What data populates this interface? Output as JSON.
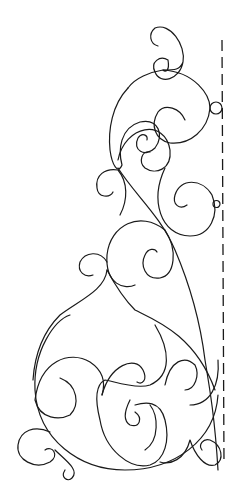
{
  "figure": {
    "stroke_color": "#1a1a1a",
    "background": "#ffffff",
    "guide_line": "dashed vertical line",
    "markers": [
      "small circle at upper right",
      "small circle at middle right"
    ]
  }
}
